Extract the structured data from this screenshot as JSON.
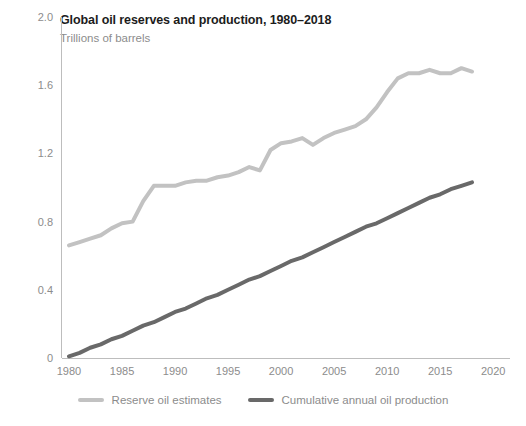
{
  "chart_data": {
    "type": "line",
    "title": "Global oil reserves and production, 1980–2018",
    "subtitle": "Trillions of barrels",
    "xlabel": "",
    "ylabel": "Trillions of barrels",
    "xlim": [
      1978.5,
      2021.0
    ],
    "ylim": [
      0,
      2.0
    ],
    "grid": false,
    "legend_position": "bottom-center",
    "x_ticks": [
      "1980",
      "1985",
      "1990",
      "1995",
      "2000",
      "2005",
      "2010",
      "2015",
      "2020"
    ],
    "x_tick_values": [
      1980,
      1985,
      1990,
      1995,
      2000,
      2005,
      2010,
      2015,
      2020
    ],
    "y_ticks": [
      "0",
      "0.4",
      "0.8",
      "1.2",
      "1.6",
      "2.0"
    ],
    "y_tick_values": [
      0,
      0.4,
      0.8,
      1.2,
      1.6,
      2.0
    ],
    "x": [
      1980,
      1981,
      1982,
      1983,
      1984,
      1985,
      1986,
      1987,
      1988,
      1989,
      1990,
      1991,
      1992,
      1993,
      1994,
      1995,
      1996,
      1997,
      1998,
      1999,
      2000,
      2001,
      2002,
      2003,
      2004,
      2005,
      2006,
      2007,
      2008,
      2009,
      2010,
      2011,
      2012,
      2013,
      2014,
      2015,
      2016,
      2017,
      2018
    ],
    "series": [
      {
        "name": "Reserve oil estimates",
        "color": "#c2c2c2",
        "values": [
          0.66,
          0.68,
          0.7,
          0.72,
          0.76,
          0.79,
          0.8,
          0.92,
          1.01,
          1.01,
          1.01,
          1.03,
          1.04,
          1.04,
          1.06,
          1.07,
          1.09,
          1.12,
          1.1,
          1.22,
          1.26,
          1.27,
          1.29,
          1.25,
          1.29,
          1.32,
          1.34,
          1.36,
          1.4,
          1.47,
          1.56,
          1.64,
          1.67,
          1.67,
          1.69,
          1.67,
          1.67,
          1.7,
          1.68
        ]
      },
      {
        "name": "Cumulative annual oil production",
        "color": "#696969",
        "values": [
          0.01,
          0.03,
          0.06,
          0.08,
          0.11,
          0.13,
          0.16,
          0.19,
          0.21,
          0.24,
          0.27,
          0.29,
          0.32,
          0.35,
          0.37,
          0.4,
          0.43,
          0.46,
          0.48,
          0.51,
          0.54,
          0.57,
          0.59,
          0.62,
          0.65,
          0.68,
          0.71,
          0.74,
          0.77,
          0.79,
          0.82,
          0.85,
          0.88,
          0.91,
          0.94,
          0.96,
          0.99,
          1.01,
          1.03
        ]
      }
    ]
  },
  "legend": {
    "items": [
      {
        "label": "Reserve oil estimates",
        "color": "#c2c2c2"
      },
      {
        "label": "Cumulative annual oil production",
        "color": "#696969"
      }
    ]
  },
  "colors": {
    "axis": "#bdbdbd",
    "tick_text": "#8c8c8c",
    "title_text": "#1c1c1c",
    "background": "#ffffff"
  }
}
